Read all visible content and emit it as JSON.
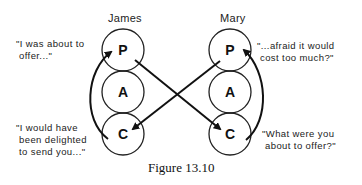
{
  "diagram": {
    "people": [
      {
        "name": "James",
        "states": [
          "P",
          "A",
          "C"
        ],
        "quotes": {
          "top": "\"I was about to\n offer...\"",
          "bottom": "\"I would have\n been delighted\n to send you...\""
        }
      },
      {
        "name": "Mary",
        "states": [
          "P",
          "A",
          "C"
        ],
        "quotes": {
          "top": "\"...afraid it would\n cost too much?\"",
          "bottom": "\"What were you\n about to offer?\""
        }
      }
    ],
    "transactions": [
      {
        "from": "James.P",
        "to": "Mary.C",
        "type": "straight-arrow"
      },
      {
        "from": "Mary.P",
        "to": "James.C",
        "type": "straight-arrow"
      },
      {
        "from": "James.C",
        "to": "James.P",
        "type": "curved-arrow"
      },
      {
        "from": "Mary.C",
        "to": "Mary.P",
        "type": "curved-arrow"
      }
    ],
    "caption": "Figure 13.10",
    "line_color": "#111111"
  }
}
